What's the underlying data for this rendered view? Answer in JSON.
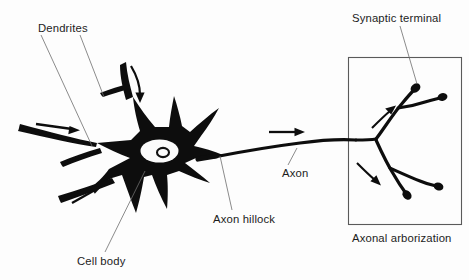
{
  "figure": {
    "background_color": "#fdfdfd",
    "ink_color": "#0d0d0d",
    "leader_color": "#6d6d6d"
  },
  "labels": {
    "dendrites": "Dendrites",
    "cell_body": "Cell body",
    "axon_hillock": "Axon hillock",
    "axon": "Axon",
    "synaptic_terminal": "Synaptic terminal",
    "axonal_arborization": "Axonal arborization"
  },
  "parts": [
    {
      "name": "dendrites",
      "label": "Dendrites",
      "description": "Branching input processes extending from the cell body",
      "leader_count": 2
    },
    {
      "name": "cell-body",
      "label": "Cell body",
      "description": "Soma containing the nucleus and nucleolus",
      "leader_count": 1
    },
    {
      "name": "axon-hillock",
      "label": "Axon hillock",
      "description": "Tapered junction where the axon leaves the soma",
      "leader_count": 1
    },
    {
      "name": "axon",
      "label": "Axon",
      "description": "Long conducting fiber running to the right",
      "leader_count": 1
    },
    {
      "name": "synaptic-terminal",
      "label": "Synaptic terminal",
      "description": "Bulbous ending of an axon branch",
      "leader_count": 1
    },
    {
      "name": "axonal-arborization",
      "label": "Axonal arborization",
      "description": "Boxed terminal branching field with four synaptic terminals",
      "leader_count": 0
    }
  ],
  "flow_arrows": [
    {
      "name": "dendrite-arrow-upper-curved",
      "direction": "down",
      "region": "upper dendrite"
    },
    {
      "name": "dendrite-arrow-left",
      "direction": "right",
      "region": "left dendrite"
    },
    {
      "name": "dendrite-arrow-lower-left",
      "direction": "up-right",
      "region": "lower-left dendrite"
    },
    {
      "name": "axon-arrow",
      "direction": "right",
      "region": "axon"
    },
    {
      "name": "arborization-arrow-upper",
      "direction": "up-right",
      "region": "upper branch"
    },
    {
      "name": "arborization-arrow-lower",
      "direction": "down-right",
      "region": "lower branch"
    }
  ],
  "terminal_count": 4
}
